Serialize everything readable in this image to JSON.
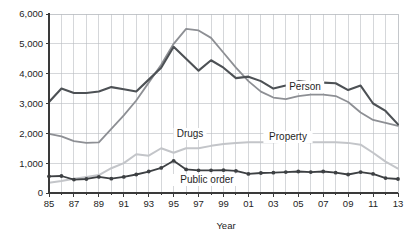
{
  "chart_data": {
    "type": "line",
    "title": "",
    "xlabel": "Year",
    "ylabel": "",
    "xlim": [
      1985,
      2013
    ],
    "ylim": [
      0,
      6000
    ],
    "ytick_step": 1000,
    "grid": true,
    "legend": "inline-annotations",
    "x": [
      1985,
      1986,
      1987,
      1988,
      1989,
      1990,
      1991,
      1992,
      1993,
      1994,
      1995,
      1996,
      1997,
      1998,
      1999,
      2000,
      2001,
      2002,
      2003,
      2004,
      2005,
      2006,
      2007,
      2008,
      2009,
      2010,
      2011,
      2012,
      2013
    ],
    "xtick_labels": [
      "85",
      "",
      "87",
      "",
      "89",
      "",
      "91",
      "",
      "93",
      "",
      "95",
      "",
      "97",
      "",
      "99",
      "",
      "01",
      "",
      "03",
      "",
      "05",
      "",
      "07",
      "",
      "09",
      "",
      "11",
      "",
      "13"
    ],
    "ytick_labels": [
      "0",
      "1,000",
      "2,000",
      "3,000",
      "4,000",
      "5,000",
      "6,000"
    ],
    "series": [
      {
        "name": "Person",
        "color": "#8d8f94",
        "values": [
          1980,
          1900,
          1740,
          1680,
          1700,
          2150,
          2600,
          3100,
          3700,
          4300,
          5000,
          5500,
          5450,
          5200,
          4700,
          4200,
          3750,
          3400,
          3200,
          3150,
          3250,
          3300,
          3300,
          3250,
          3050,
          2700,
          2450,
          2350,
          2250
        ]
      },
      {
        "name": "Property",
        "color": "#4d5155",
        "values": [
          3050,
          3500,
          3350,
          3350,
          3400,
          3550,
          3480,
          3400,
          3800,
          4200,
          4900,
          4500,
          4100,
          4450,
          4200,
          3850,
          3900,
          3750,
          3500,
          3600,
          3750,
          3700,
          3700,
          3680,
          3450,
          3600,
          3000,
          2750,
          2300
        ]
      },
      {
        "name": "Drugs",
        "color": "#c3c5c9",
        "values": [
          340,
          400,
          480,
          540,
          600,
          830,
          1000,
          1300,
          1250,
          1500,
          1350,
          1500,
          1500,
          1580,
          1640,
          1680,
          1700,
          1700,
          1700,
          1720,
          1720,
          1700,
          1700,
          1700,
          1680,
          1620,
          1350,
          1050,
          820
        ]
      },
      {
        "name": "Public order",
        "color": "#3d4043",
        "markers": true,
        "values": [
          560,
          570,
          450,
          470,
          540,
          480,
          540,
          620,
          720,
          840,
          1080,
          790,
          760,
          760,
          770,
          740,
          640,
          670,
          680,
          700,
          720,
          700,
          720,
          680,
          620,
          700,
          640,
          500,
          470
        ]
      }
    ],
    "annotations": [
      {
        "text": "Person",
        "series": "Person"
      },
      {
        "text": "Property",
        "series": "Property"
      },
      {
        "text": "Drugs",
        "series": "Drugs"
      },
      {
        "text": "Public order",
        "series": "Public order"
      }
    ]
  },
  "axis": {
    "x_title": "Year"
  },
  "labels": {
    "person": "Person",
    "property": "Property",
    "drugs": "Drugs",
    "public_order": "Public order"
  }
}
